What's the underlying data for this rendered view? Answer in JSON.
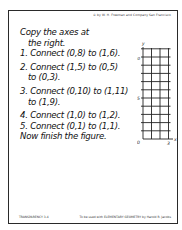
{
  "header": {
    "copyright": "© by W. H. Freeman and Company  San Francisco"
  },
  "instructions": {
    "intro_line1": "Copy the axes at",
    "intro_line2": "the right.",
    "steps": [
      {
        "line1": "1. Connect (0,8) to (1,6).",
        "line2": ""
      },
      {
        "line1": "2. Connect (1,5) to (0,5)",
        "line2": "to (0,3)."
      },
      {
        "line1": "3. Connect (0,10) to (1,11)",
        "line2": "to (1,9)."
      },
      {
        "line1": "4. Connect (1,0) to (1,2).",
        "line2": ""
      },
      {
        "line1": "5. Connect (0,1) to (1,1).",
        "line2": ""
      }
    ],
    "closing": "Now finish the figure."
  },
  "grid": {
    "x_axis_label": "x",
    "y_axis_label": "y",
    "origin_label": "0",
    "x_tick_label": "3",
    "y_tick_labels": {
      "5": "5",
      "10": "10"
    },
    "x_max": 3,
    "y_max": 11
  },
  "footer": {
    "left": "TRANSPARENCY 3-4",
    "right": "To be used with ELEMENTARY GEOMETRY by Harold R. Jacobs"
  }
}
